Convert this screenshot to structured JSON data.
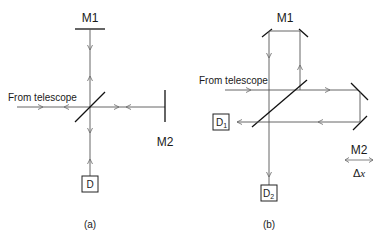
{
  "figure": {
    "panel_a": {
      "caption": "(a)",
      "mirror1_label": "M1",
      "mirror2_label": "M2",
      "input_label": "From telescope",
      "detector_label": "D"
    },
    "panel_b": {
      "caption": "(b)",
      "mirror1_label": "M1",
      "mirror2_label": "M2",
      "input_label": "From telescope",
      "detector1_label": "D",
      "detector1_sub": "1",
      "detector2_label": "D",
      "detector2_sub": "2",
      "displacement_symbol": "Δ",
      "displacement_var": "x"
    }
  }
}
